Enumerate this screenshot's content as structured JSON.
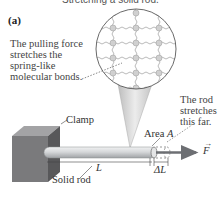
{
  "figure": {
    "top_caption_clipped": "Stretching a solid rod.",
    "panel_label": "(a)",
    "callouts": {
      "molecular": [
        "The pulling force",
        "stretches the",
        "spring-like",
        "molecular bonds."
      ],
      "stretch": [
        "The rod",
        "stretches",
        "this far."
      ]
    },
    "labels": {
      "clamp": "Clamp",
      "solid_rod": "Solid rod",
      "length": "L",
      "delta_length": "ΔL",
      "area_prefix": "Area ",
      "area_symbol": "A",
      "force": "F"
    },
    "colors": {
      "rod": "#c9cccf",
      "clamp_front": "#6e6e70",
      "clamp_top": "#9a9a9c",
      "arrow": "#6d6f73",
      "lattice_bond": "#9a9a9a",
      "atom": "#cfcfcf",
      "cone": "#d4d4d4"
    }
  }
}
